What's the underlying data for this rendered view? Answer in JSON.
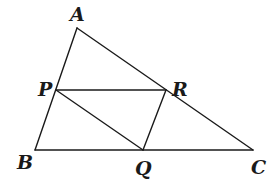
{
  "diagram": {
    "type": "geometry-triangle",
    "points": {
      "A": {
        "label": "A",
        "x": 77,
        "y": 28
      },
      "B": {
        "label": "B",
        "x": 35,
        "y": 150
      },
      "C": {
        "label": "C",
        "x": 253,
        "y": 150
      },
      "P": {
        "label": "P",
        "x": 56,
        "y": 90
      },
      "Q": {
        "label": "Q",
        "x": 143,
        "y": 150
      },
      "R": {
        "label": "R",
        "x": 166,
        "y": 90
      }
    },
    "labels": {
      "A": "A",
      "B": "B",
      "C": "C",
      "P": "P",
      "Q": "Q",
      "R": "R"
    },
    "segments": [
      [
        "A",
        "B"
      ],
      [
        "B",
        "C"
      ],
      [
        "A",
        "C"
      ],
      [
        "P",
        "R"
      ],
      [
        "P",
        "Q"
      ],
      [
        "Q",
        "R"
      ]
    ],
    "stroke_color": "#1a1a1a",
    "background": "#ffffff"
  }
}
